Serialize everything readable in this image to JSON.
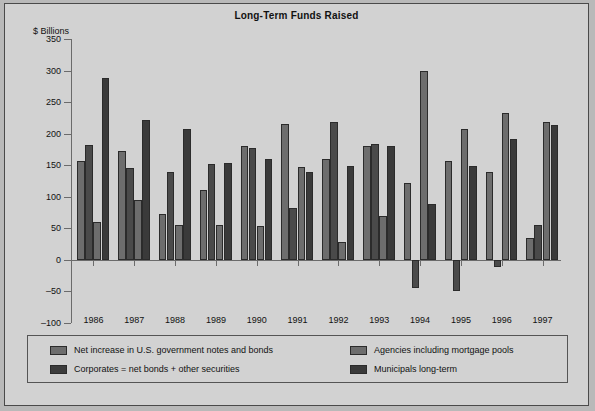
{
  "chart_data": {
    "type": "bar",
    "title": "Long-Term Funds Raised",
    "ylabel": "$ Billions",
    "xlabel": "",
    "ylim": [
      -100,
      350
    ],
    "yticks": [
      350,
      300,
      250,
      200,
      150,
      100,
      50,
      0,
      -50,
      -100
    ],
    "ytick_labels": [
      "350",
      "300",
      "250",
      "200",
      "150",
      "100",
      "50",
      "0",
      "–50",
      "–100"
    ],
    "grid": false,
    "legend_position": "bottom",
    "categories": [
      "1986",
      "1987",
      "1988",
      "1989",
      "1990",
      "1991",
      "1992",
      "1993",
      "1994",
      "1995",
      "1996",
      "1997"
    ],
    "series": [
      {
        "name": "Net increase in U.S. government notes and bonds",
        "color": "#6d6d6d",
        "values": [
          157,
          172,
          73,
          110,
          180,
          215,
          160,
          180,
          122,
          157,
          140,
          35
        ]
      },
      {
        "name": "Corporates = net bonds + other securities",
        "color": "#4a4a4a",
        "values": [
          182,
          145,
          140,
          152,
          177,
          82,
          218,
          183,
          -45,
          -50,
          -11,
          55
        ]
      },
      {
        "name": "Agencies including mortgage pools",
        "color": "#6d6d6d",
        "values": [
          60,
          95,
          55,
          55,
          53,
          147,
          28,
          70,
          300,
          208,
          232,
          218
        ]
      },
      {
        "name": "Municipals long-term",
        "color": "#3a3a3a",
        "values": [
          288,
          221,
          208,
          154,
          160,
          140,
          148,
          181,
          89,
          148,
          192,
          213
        ]
      }
    ]
  },
  "legend": {
    "items": [
      {
        "label": "Net increase in U.S. government notes and bonds",
        "color": "#6d6d6d"
      },
      {
        "label": "Corporates = net bonds + other securities",
        "color": "#3c3c3c"
      },
      {
        "label": "Agencies including mortgage pools",
        "color": "#6d6d6d"
      },
      {
        "label": "Municipals long-term",
        "color": "#3a3a3a"
      }
    ]
  }
}
